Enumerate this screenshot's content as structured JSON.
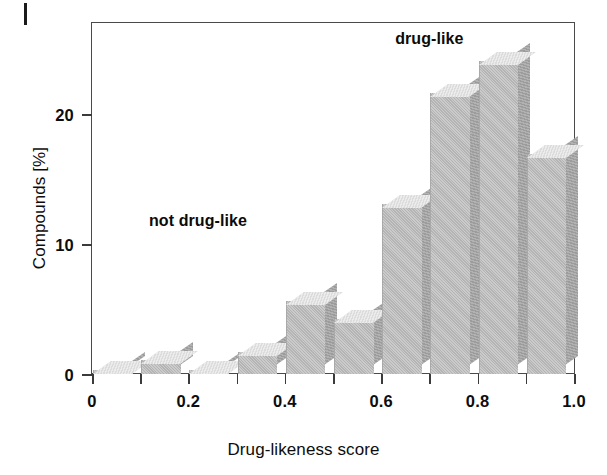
{
  "figure": {
    "background_color": "#ffffff",
    "bar_front_color": "#b4b4b4",
    "bar_side_color": "#9c9c9c",
    "bar_top_color": "#dcdcdc",
    "axis_color": "#4a4a4a"
  },
  "page_mark": {
    "name": "page-edge-mark"
  },
  "chart_data": {
    "type": "bar",
    "title": "",
    "xlabel": "Drug-likeness score",
    "ylabel": "Compounds [%]",
    "xlim": [
      0,
      1.0
    ],
    "ylim": [
      0,
      27
    ],
    "grid": false,
    "legend": null,
    "bin_width": 0.1,
    "categories": [
      "0-0.1",
      "0.1-0.2",
      "0.2-0.3",
      "0.3-0.4",
      "0.4-0.5",
      "0.5-0.6",
      "0.6-0.7",
      "0.7-0.8",
      "0.8-0.9",
      "0.9-1.0"
    ],
    "bin_starts": [
      0.0,
      0.1,
      0.2,
      0.3,
      0.4,
      0.5,
      0.6,
      0.7,
      0.8,
      0.9
    ],
    "values": [
      0.3,
      1.1,
      0.3,
      1.7,
      5.6,
      4.2,
      13.1,
      21.6,
      24.1,
      16.9
    ],
    "xticks": [
      0,
      0.2,
      0.4,
      0.6,
      0.8,
      1.0
    ],
    "xticklabels": [
      "0",
      "0.2",
      "0.4",
      "0.6",
      "0.8",
      "1.0"
    ],
    "xminorticks": [
      0.1,
      0.3,
      0.5,
      0.7,
      0.9
    ],
    "yticks": [
      0,
      10,
      20
    ],
    "yticklabels": [
      "0",
      "10",
      "20"
    ],
    "annotations": [
      {
        "text": "not drug-like",
        "x": 0.22,
        "y": 11.8
      },
      {
        "text": "drug-like",
        "x": 0.7,
        "y": 25.8
      }
    ]
  }
}
